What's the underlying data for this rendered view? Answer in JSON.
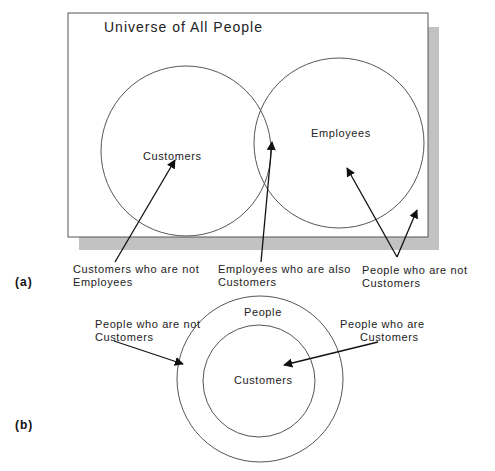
{
  "diagram_a": {
    "panel_label": "(a)",
    "universe_title": "Universe of All People",
    "circles": {
      "customers": "Customers",
      "employees": "Employees"
    },
    "callouts": {
      "customers_not_employees": [
        "Customers who are not",
        "Employees"
      ],
      "employees_also_customers": [
        "Employees who are also",
        "Customers"
      ],
      "people_not_customers": [
        "People who are not",
        "Customers"
      ]
    }
  },
  "diagram_b": {
    "panel_label": "(b)",
    "outer_circle": "People",
    "inner_circle": "Customers",
    "callouts": {
      "people_not_customers": [
        "People who are not",
        "Customers"
      ],
      "people_are_customers": [
        "People who are",
        "Customers"
      ]
    }
  },
  "colors": {
    "line": "#222222",
    "circle_stroke": "#555555",
    "shadow": "#bdbdbd"
  }
}
